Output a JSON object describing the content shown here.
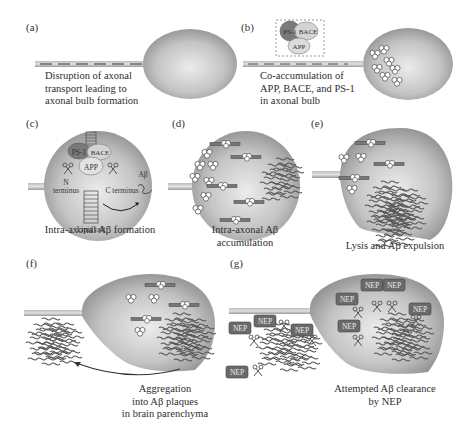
{
  "figure": {
    "panels": [
      {
        "id": "a",
        "label": "(a)",
        "caption_lines": [
          "Disruption of axonal",
          "transport leading to",
          "axonal bulb formation"
        ]
      },
      {
        "id": "b",
        "label": "(b)",
        "caption_lines": [
          "Co-accumulation of",
          "APP, BACE, and PS-1",
          "in axonal bulb"
        ],
        "inset": {
          "ps1": "PS-1",
          "bace": "BACE",
          "app": "APP"
        }
      },
      {
        "id": "c",
        "label": "(c)",
        "caption_lines": [
          "Intra-axonal Aβ formation"
        ],
        "labels": {
          "ps1": "PS-1",
          "bace": "BACE",
          "app": "APP",
          "n_terminus_1": "N",
          "n_terminus_2": "terminus",
          "c_terminus": "C terminus",
          "abeta": "Aβ",
          "lipid_raft": "Lipid raft"
        }
      },
      {
        "id": "d",
        "label": "(d)",
        "caption_lines": [
          "Intra-axonal Aβ",
          "accumulation"
        ]
      },
      {
        "id": "e",
        "label": "(e)",
        "caption_lines": [
          "Lysis and Aβ expulsion"
        ]
      },
      {
        "id": "f",
        "label": "(f)",
        "caption_lines": [
          "Aggregation",
          "into Aβ plaques",
          "in brain parenchyma"
        ]
      },
      {
        "id": "g",
        "label": "(g)",
        "caption_lines": [
          "Attempted Aβ clearance",
          "by NEP"
        ],
        "enzyme_label": "NEP"
      }
    ]
  },
  "colors": {
    "bulb_light": "#e6e6e6",
    "bulb_dark": "#8f8f8f",
    "ps1": "#7a7a7a",
    "protein_light": "#d6d6d6",
    "plaque_stroke": "#555555",
    "nep_box": "#6e6e6e"
  }
}
